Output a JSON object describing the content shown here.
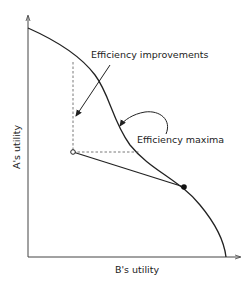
{
  "diagram": {
    "y_axis_label": "A's utility",
    "x_axis_label": "B's utility",
    "annotations": {
      "efficiency_improvements": "Efficiency improvements",
      "efficiency_maxima": "Efficiency maxima"
    },
    "elements": {
      "frontier": "utility possibility frontier curve",
      "start_point": "open circle (inefficient point)",
      "end_point": "filled circle (point on frontier)"
    },
    "colors": {
      "line": "#222222",
      "background": "#ffffff"
    }
  }
}
